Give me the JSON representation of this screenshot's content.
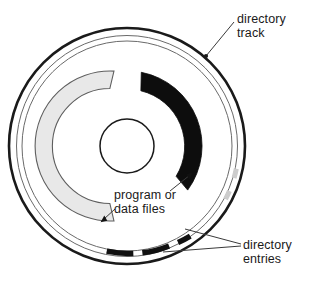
{
  "diagram": {
    "type": "annotated-circular-disk",
    "background_color": "#ffffff",
    "ink_color": "#1a1a1a"
  },
  "labels": {
    "directory_track": {
      "line1": "directory",
      "line2": "track"
    },
    "program_data_files": {
      "line1": "program or",
      "line2": "data files"
    },
    "directory_entries": {
      "line1": "directory",
      "line2": "entries"
    }
  },
  "geometry": {
    "center_x": 127,
    "center_y": 146,
    "outer_radius": 118,
    "track_outer_radius": 110,
    "track_inner_radius": 104,
    "hub_radius": 27
  },
  "colors": {
    "outline": "#1a1a1a",
    "track_line": "#555555",
    "data_arc_dark": "#0d0d0d",
    "data_arc_light": "#e4e4e4",
    "data_arc_light_edge": "#6b6b6b",
    "leader_line": "#3a3a3a"
  },
  "arcs": [
    {
      "name": "program-files-arc-dark",
      "fill": "#0d0d0d",
      "start_angle_deg": -79,
      "end_angle_deg": 36,
      "inner_radius": 57,
      "outer_radius": 75
    },
    {
      "name": "data-files-arc-light",
      "fill": "#e4e4e4",
      "start_angle_deg": 100,
      "end_angle_deg": 261,
      "inner_radius": 57,
      "outer_radius": 75
    }
  ],
  "directory_entry_segments": [
    {
      "name": "directory-entry-segment-1",
      "start_angle_deg": 55,
      "end_angle_deg": 62
    },
    {
      "name": "directory-entry-segment-2",
      "start_angle_deg": 67,
      "end_angle_deg": 82
    },
    {
      "name": "directory-entry-segment-3",
      "start_angle_deg": 87,
      "end_angle_deg": 103
    }
  ]
}
